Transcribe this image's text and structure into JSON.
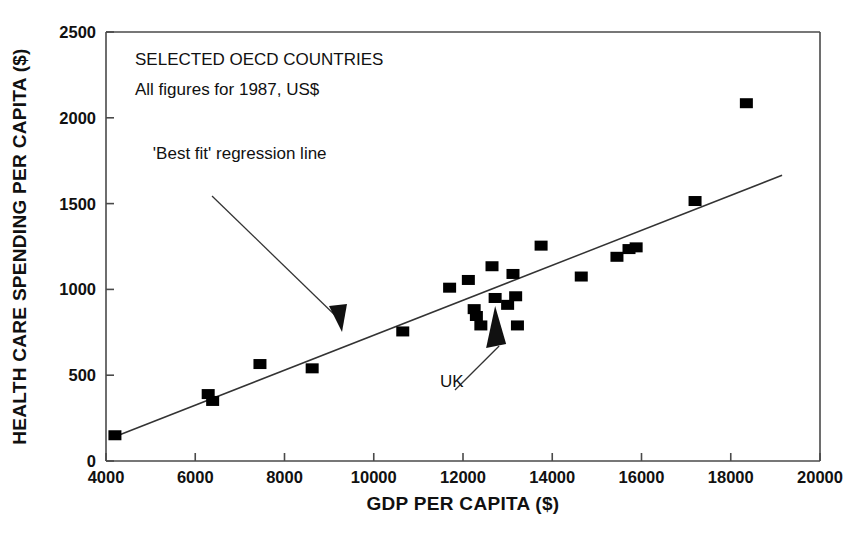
{
  "chart_data": {
    "type": "scatter",
    "title": "",
    "xlabel": "GDP PER CAPITA ($)",
    "ylabel": "HEALTH CARE SPENDING PER CAPITA ($)",
    "xlim": [
      4000,
      20000
    ],
    "ylim": [
      0,
      2500
    ],
    "xticks": [
      "4000",
      "6000",
      "8000",
      "10000",
      "12000",
      "14000",
      "16000",
      "18000",
      "20000"
    ],
    "xtick_values": [
      4000,
      6000,
      8000,
      10000,
      12000,
      14000,
      16000,
      18000,
      20000
    ],
    "yticks": [
      "0",
      "500",
      "1000",
      "1500",
      "2000",
      "2500"
    ],
    "ytick_values": [
      0,
      500,
      1000,
      1500,
      2000,
      2500
    ],
    "grid": false,
    "legend": "none",
    "annotations": [
      {
        "id": "heading",
        "text": "SELECTED OECD COUNTRIES",
        "x": 4650,
        "y": 2310
      },
      {
        "id": "subheading",
        "text": "All figures for 1987, US$",
        "x": 4650,
        "y": 2130
      },
      {
        "id": "regression-label",
        "text": "'Best fit' regression line",
        "x": 5050,
        "y": 1760
      },
      {
        "id": "uk-label",
        "text": "UK",
        "x": 11750,
        "y": 430
      }
    ],
    "regression_line": {
      "label": "'Best fit' regression line",
      "x_start": 4180,
      "y_start": 140,
      "x_end": 19150,
      "y_end": 1665
    },
    "points": [
      {
        "x": 4200,
        "y": 150
      },
      {
        "x": 6290,
        "y": 390
      },
      {
        "x": 6390,
        "y": 350
      },
      {
        "x": 7450,
        "y": 565
      },
      {
        "x": 8620,
        "y": 540
      },
      {
        "x": 10650,
        "y": 755
      },
      {
        "x": 11700,
        "y": 1010
      },
      {
        "x": 12120,
        "y": 1055
      },
      {
        "x": 12250,
        "y": 885
      },
      {
        "x": 12300,
        "y": 845
      },
      {
        "x": 12400,
        "y": 790
      },
      {
        "x": 12650,
        "y": 1135
      },
      {
        "x": 12720,
        "y": 950
      },
      {
        "x": 13000,
        "y": 910
      },
      {
        "x": 13120,
        "y": 1090
      },
      {
        "x": 13180,
        "y": 960
      },
      {
        "x": 13220,
        "y": 790
      },
      {
        "x": 13750,
        "y": 1255
      },
      {
        "x": 14650,
        "y": 1075
      },
      {
        "x": 15450,
        "y": 1190
      },
      {
        "x": 15720,
        "y": 1235
      },
      {
        "x": 15880,
        "y": 1245
      },
      {
        "x": 17200,
        "y": 1515
      },
      {
        "x": 18350,
        "y": 2085
      }
    ],
    "uk_point": {
      "x": 12720,
      "y": 950
    },
    "colors": {
      "marker": "#000000",
      "line": "#333333",
      "axis": "#4a4a4a",
      "background": "#ffffff",
      "text": "#111111"
    }
  }
}
